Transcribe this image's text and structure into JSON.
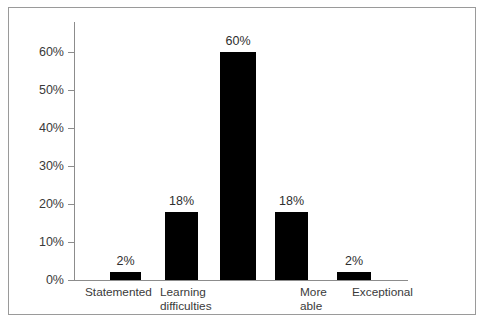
{
  "chart_data": {
    "type": "bar",
    "title": "",
    "subtitle": "",
    "xlabel": "",
    "ylabel": "",
    "categories": [
      "Statemented",
      "Learning difficulties",
      "",
      "More able",
      "Exceptional"
    ],
    "values": [
      2,
      18,
      60,
      18,
      2
    ],
    "value_labels": [
      "2%",
      "18%",
      "60%",
      "18%",
      "2%"
    ],
    "ylim": [
      0,
      60
    ],
    "ytick_values": [
      0,
      10,
      20,
      30,
      40,
      50,
      60
    ],
    "ytick_labels": [
      "0%",
      "10%",
      "20%",
      "30%",
      "40%",
      "50%",
      "60%"
    ],
    "grid": false,
    "legend": "none",
    "bar_color": "#000000",
    "axis_color": "#8c8c8c",
    "text_color": "#3a3a3a",
    "frame_color": "#9a9a9a",
    "background": "#ffffff",
    "category_lines": [
      [
        "Statemented"
      ],
      [
        "Learning",
        "difficulties"
      ],
      [
        ""
      ],
      [
        "More",
        "able"
      ],
      [
        "Exceptional"
      ]
    ]
  }
}
